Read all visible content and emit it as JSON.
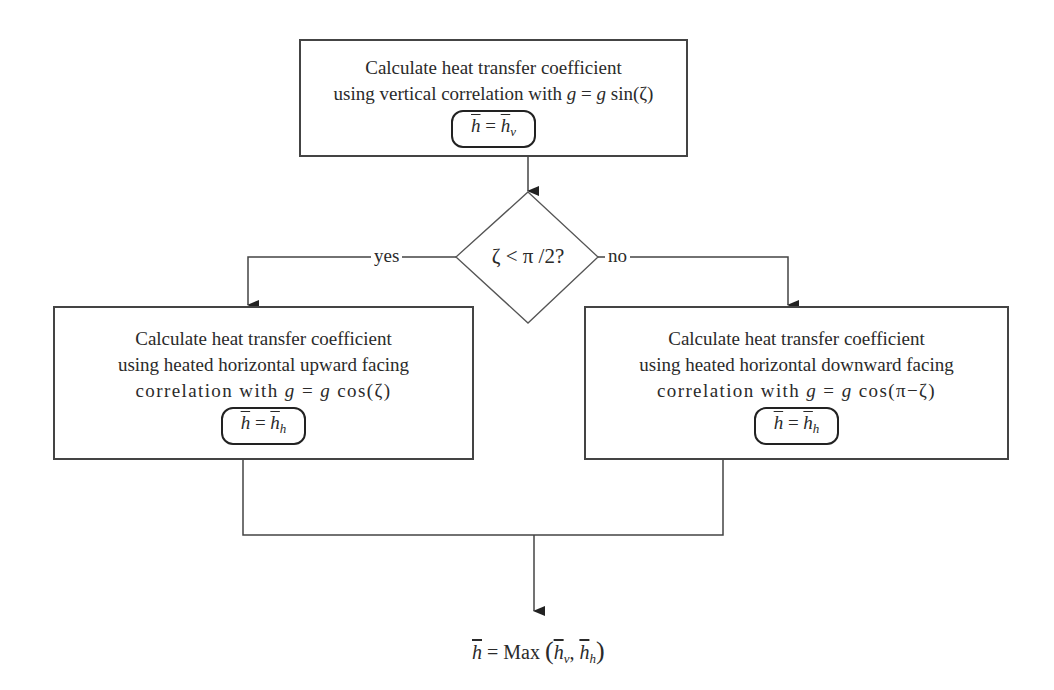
{
  "diagram": {
    "top_box": {
      "line1": "Calculate heat transfer coefficient",
      "line2_prefix": "using vertical correlation with ",
      "line2_math": {
        "var": "g",
        "eq": " = ",
        "var2": "g",
        "func": " sin(ζ)"
      },
      "result": {
        "lhs": "h",
        "eq": " = ",
        "rhs": "h",
        "sub": "v"
      }
    },
    "decision": {
      "text": "ζ < π /2?",
      "yes_label": "yes",
      "no_label": "no"
    },
    "left_box": {
      "line1": "Calculate heat transfer coefficient",
      "line2": "using heated horizontal upward facing",
      "line3_prefix": "correlation with ",
      "line3_math": {
        "var": "g",
        "eq": " = ",
        "var2": "g",
        "func": " cos(ζ)"
      },
      "result": {
        "lhs": "h",
        "eq": " = ",
        "rhs": "h",
        "sub": "h"
      }
    },
    "right_box": {
      "line1": "Calculate heat transfer coefficient",
      "line2": "using heated horizontal downward facing",
      "line3_prefix": "correlation with ",
      "line3_math": {
        "var": "g",
        "eq": " = ",
        "var2": "g",
        "func": " cos(π−ζ)"
      },
      "result": {
        "lhs": "h",
        "eq": " = ",
        "rhs": "h",
        "sub": "h"
      }
    },
    "final": {
      "lhs": "h",
      "eq": " = Max ",
      "open": "(",
      "arg1": "h",
      "arg1_sub": "v",
      "sep": ", ",
      "arg2": "h",
      "arg2_sub": "h",
      "close": ")"
    },
    "colors": {
      "line": "#444444",
      "text": "#2a2a2a",
      "background": "#ffffff"
    }
  }
}
